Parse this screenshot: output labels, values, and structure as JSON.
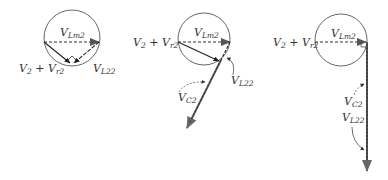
{
  "diagrams": [
    {
      "id": "diagram-1",
      "labels": {
        "vlm": {
          "base": "V",
          "sub": "Lm2"
        },
        "v2vr": {
          "a": "V",
          "a_sub": "2",
          "plus": " + ",
          "b": "V",
          "b_sub": "r2"
        },
        "vl": {
          "base": "V",
          "sub": "L22"
        }
      }
    },
    {
      "id": "diagram-2",
      "labels": {
        "vlm": {
          "base": "V",
          "sub": "Lm2"
        },
        "v2vr": {
          "a": "V",
          "a_sub": "2",
          "plus": " + ",
          "b": "V",
          "b_sub": "r2"
        },
        "vl": {
          "base": "V",
          "sub": "L22"
        },
        "vc": {
          "base": "V",
          "sub": "C2"
        }
      }
    },
    {
      "id": "diagram-3",
      "labels": {
        "vlm": {
          "base": "V",
          "sub": "Lm2"
        },
        "v2vr": {
          "a": "V",
          "a_sub": "2",
          "plus": " + ",
          "b": "V",
          "b_sub": "r2"
        },
        "vc": {
          "base": "V",
          "sub": "C2"
        },
        "vl": {
          "base": "V",
          "sub": "L22"
        }
      }
    }
  ],
  "colors": {
    "line": "#333333",
    "arrow": "#555555",
    "circle": "#555555"
  }
}
